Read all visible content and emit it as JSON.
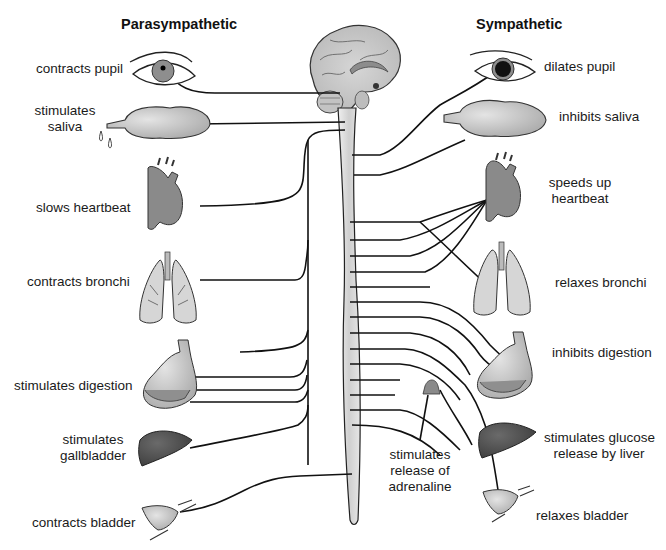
{
  "headings": {
    "left": "Parasympathetic",
    "right": "Sympathetic"
  },
  "parasympathetic": {
    "items": [
      {
        "organ": "eye",
        "label": "contracts pupil"
      },
      {
        "organ": "salivary-gland",
        "label_line1": "stimulates",
        "label_line2": "saliva"
      },
      {
        "organ": "heart",
        "label": "slows heartbeat"
      },
      {
        "organ": "lungs",
        "label": "contracts bronchi"
      },
      {
        "organ": "stomach",
        "label": "stimulates digestion"
      },
      {
        "organ": "liver",
        "label_line1": "stimulates",
        "label_line2": "gallbladder"
      },
      {
        "organ": "bladder",
        "label": "contracts bladder"
      }
    ]
  },
  "sympathetic": {
    "items": [
      {
        "organ": "eye",
        "label": "dilates pupil"
      },
      {
        "organ": "salivary-gland",
        "label": "inhibits saliva"
      },
      {
        "organ": "heart",
        "label_line1": "speeds up",
        "label_line2": "heartbeat"
      },
      {
        "organ": "lungs",
        "label": "relaxes bronchi"
      },
      {
        "organ": "stomach",
        "label": "inhibits digestion"
      },
      {
        "organ": "liver",
        "label_line1": "stimulates glucose",
        "label_line2": "release by liver"
      },
      {
        "organ": "bladder",
        "label": "relaxes bladder"
      }
    ]
  },
  "center": {
    "adrenal": {
      "line1": "stimulates",
      "line2": "release of",
      "line3": "adrenaline"
    }
  },
  "colors": {
    "line": "#111111",
    "organ_fill_light": "#cfcfcf",
    "organ_fill_mid": "#9a9a9a",
    "organ_fill_dark": "#4a4a4a",
    "spinal_cord": "#d9d9d9"
  }
}
